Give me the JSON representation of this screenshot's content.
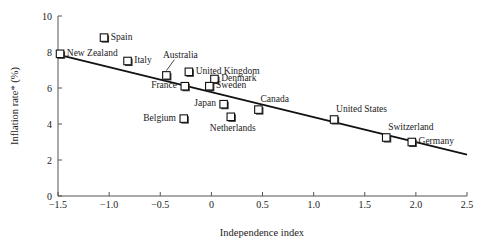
{
  "chart_data": {
    "type": "scatter",
    "title": "",
    "xlabel": "Independence index",
    "ylabel": "Inflation rate* (%)",
    "xlim": [
      -1.5,
      2.5
    ],
    "ylim": [
      0,
      10
    ],
    "xticks": [
      "−1.5",
      "−1.0",
      "−0.5",
      "0",
      "0.5",
      "1.0",
      "1.5",
      "2.0",
      "2.5"
    ],
    "xtick_values": [
      -1.5,
      -1.0,
      -0.5,
      0,
      0.5,
      1.0,
      1.5,
      2.0,
      2.5
    ],
    "yticks": [
      "0",
      "2",
      "4",
      "6",
      "8",
      "10"
    ],
    "ytick_values": [
      0,
      2,
      4,
      6,
      8,
      10
    ],
    "grid": false,
    "legend": "none",
    "marker": "open-square",
    "points": [
      {
        "label": "New Zealand",
        "x": -1.48,
        "y": 7.9,
        "label_pos": "right"
      },
      {
        "label": "Spain",
        "x": -1.05,
        "y": 8.8,
        "label_pos": "right"
      },
      {
        "label": "Italy",
        "x": -0.82,
        "y": 7.5,
        "label_pos": "right"
      },
      {
        "label": "Australia",
        "x": -0.44,
        "y": 6.7,
        "label_pos": "leader-up"
      },
      {
        "label": "United Kingdom",
        "x": -0.22,
        "y": 6.9,
        "label_pos": "right"
      },
      {
        "label": "France",
        "x": -0.26,
        "y": 6.1,
        "label_pos": "left"
      },
      {
        "label": "Denmark",
        "x": 0.03,
        "y": 6.5,
        "label_pos": "right"
      },
      {
        "label": "Sweden",
        "x": -0.02,
        "y": 6.1,
        "label_pos": "right"
      },
      {
        "label": "Belgium",
        "x": -0.27,
        "y": 4.3,
        "label_pos": "left"
      },
      {
        "label": "Japan",
        "x": 0.12,
        "y": 5.1,
        "label_pos": "left"
      },
      {
        "label": "Netherlands",
        "x": 0.19,
        "y": 4.4,
        "label_pos": "below"
      },
      {
        "label": "Canada",
        "x": 0.46,
        "y": 4.8,
        "label_pos": "above-right"
      },
      {
        "label": "United States",
        "x": 1.2,
        "y": 4.25,
        "label_pos": "above-right"
      },
      {
        "label": "Switzerland",
        "x": 1.71,
        "y": 3.25,
        "label_pos": "above-right"
      },
      {
        "label": "Germany",
        "x": 1.96,
        "y": 3.0,
        "label_pos": "right"
      }
    ],
    "trend_line": {
      "x1": -1.5,
      "y1": 7.85,
      "x2": 2.5,
      "y2": 2.3
    }
  }
}
